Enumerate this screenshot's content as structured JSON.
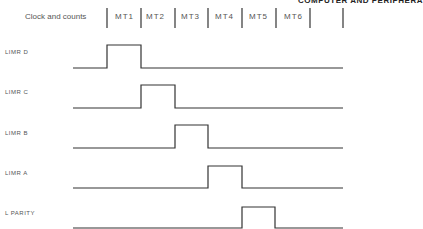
{
  "running_head": "COMPUTER AND PERIPHERA",
  "header": {
    "clock_label": "Clock and counts",
    "intervals": [
      "MT1",
      "MT2",
      "MT3",
      "MT4",
      "MT5",
      "MT6"
    ],
    "tick_x": [
      107,
      141,
      175,
      208,
      242,
      276,
      310,
      343
    ]
  },
  "signals": [
    {
      "label": "LIMR D",
      "high_start": 107,
      "high_end": 141,
      "base_y": 68,
      "top_y": 45,
      "label_y": 49
    },
    {
      "label": "LIMR C",
      "high_start": 141,
      "high_end": 175,
      "base_y": 108,
      "top_y": 85,
      "label_y": 89
    },
    {
      "label": "LIMR B",
      "high_start": 175,
      "high_end": 208,
      "base_y": 148,
      "top_y": 125,
      "label_y": 130
    },
    {
      "label": "LIMR A",
      "high_start": 208,
      "high_end": 242,
      "base_y": 188,
      "top_y": 166,
      "label_y": 170
    },
    {
      "label": "L PARITY",
      "high_start": 242,
      "high_end": 275,
      "base_y": 228,
      "top_y": 207,
      "label_y": 210
    }
  ],
  "waveform": {
    "x_start": 73,
    "x_end": 343,
    "color": "#333333"
  }
}
